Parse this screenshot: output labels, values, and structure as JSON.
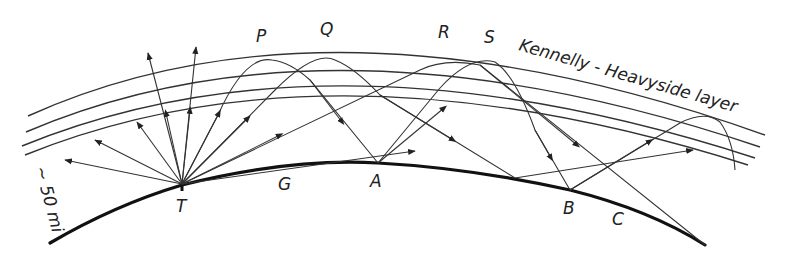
{
  "diagram": {
    "layer_label": "Kennelly - Heavyside   layer",
    "scale_label": "~ 50 mi",
    "points": {
      "transmitter": "T",
      "ground_wave": "G",
      "a": "A",
      "b": "B",
      "c": "C",
      "p": "P",
      "q": "Q",
      "r": "R",
      "s": "S"
    },
    "colors": {
      "background": "#ffffff",
      "ink": "#222222"
    }
  }
}
